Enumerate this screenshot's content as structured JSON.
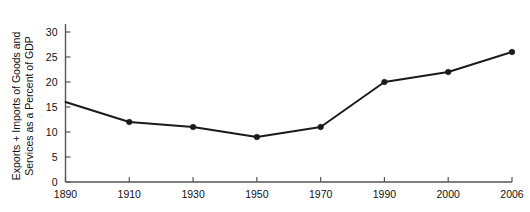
{
  "chart_data": {
    "type": "line",
    "title": "",
    "subtitle": "",
    "xlabel": "",
    "ylabel_line1": "Exports + Imports of Goods and",
    "ylabel_line2": "Services as a Percent of GDP",
    "categories": [
      "1890",
      "1910",
      "1930",
      "1950",
      "1970",
      "1990",
      "2000",
      "2006"
    ],
    "values": [
      16,
      12,
      11,
      9,
      11,
      20,
      22,
      26
    ],
    "series": [
      {
        "name": "Exports + Imports of Goods and Services as a Percent of GDP",
        "values": [
          16,
          12,
          11,
          9,
          11,
          20,
          22,
          26
        ]
      }
    ],
    "ylim": [
      0,
      32
    ],
    "yticks": [
      0,
      5,
      10,
      15,
      20,
      25,
      30
    ],
    "ytick_labels": [
      "0",
      "5",
      "10",
      "15",
      "20",
      "25",
      "30"
    ],
    "xtick_labels": [
      "1890",
      "1910",
      "1930",
      "1950",
      "1970",
      "1990",
      "2000",
      "2006"
    ],
    "grid": false,
    "legend": "none",
    "marker": "filled-circle",
    "line_color": "#1a1a1a",
    "marker_color": "#1a1a1a",
    "axis_color": "#555555",
    "text_color": "#111111",
    "background": "#ffffff",
    "first_point_marker_visible": false,
    "axis_spacing": "categorical-even"
  }
}
